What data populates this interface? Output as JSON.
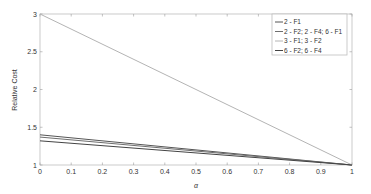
{
  "chart_data": {
    "type": "line",
    "title": "",
    "xlabel": "α",
    "ylabel": "Relative Cost",
    "xlim": [
      0,
      1
    ],
    "ylim": [
      1,
      3
    ],
    "xticks": [
      "0",
      "0.1",
      "0.2",
      "0.3",
      "0.4",
      "0.5",
      "0.6",
      "0.7",
      "0.8",
      "0.9",
      "1"
    ],
    "yticks": [
      "1",
      "1.5",
      "2",
      "2.5",
      "3"
    ],
    "grid": false,
    "legend_position": "upper right",
    "series": [
      {
        "name": "2 - F1",
        "color": "#555555",
        "x": [
          0,
          1
        ],
        "y": [
          1.4,
          1.0
        ]
      },
      {
        "name": "2 - F2; 2 - F4; 6 - F1",
        "color": "#6e6e6e",
        "x": [
          0,
          1
        ],
        "y": [
          1.37,
          1.0
        ]
      },
      {
        "name": "3 - F1; 3 - F2",
        "color": "#b4b4b4",
        "x": [
          0,
          1
        ],
        "y": [
          3.0,
          1.0
        ]
      },
      {
        "name": "6 - F2; 6 - F4",
        "color": "#444444",
        "x": [
          0,
          1
        ],
        "y": [
          1.32,
          1.0
        ]
      }
    ]
  }
}
